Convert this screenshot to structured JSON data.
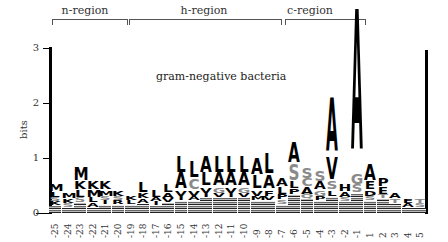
{
  "chart_data": {
    "type": "sequence-logo",
    "title": "gram-negative bacteria",
    "xlabel": "",
    "ylabel": "bits",
    "ylim": [
      0,
      3
    ],
    "yticks": [
      "0",
      "1",
      "2",
      "3"
    ],
    "regions": [
      {
        "label": "n-region",
        "from": "-25",
        "to": "-20"
      },
      {
        "label": "h-region",
        "from": "-19",
        "to": "-8"
      },
      {
        "label": "c-region",
        "from": "-6",
        "to": "-1"
      }
    ],
    "positions": [
      "-25",
      "-24",
      "-23",
      "-22",
      "-21",
      "-20",
      "-19",
      "-18",
      "-17",
      "-16",
      "-15",
      "-14",
      "-13",
      "-12",
      "-11",
      "-10",
      "-9",
      "-8",
      "-7",
      "-6",
      "-5",
      "-4",
      "-3",
      "-2",
      "-1",
      "1",
      "2",
      "3",
      "4",
      "5"
    ],
    "stacks": [
      {
        "pos": "-25",
        "total": 0.5,
        "letters": [
          {
            "aa": "M",
            "bits": 0.12
          },
          {
            "aa": "L",
            "bits": 0.1
          },
          {
            "aa": "K",
            "bits": 0.08
          },
          {
            "aa": "S",
            "bits": 0.08
          }
        ]
      },
      {
        "pos": "-24",
        "total": 0.35,
        "letters": [
          {
            "aa": "M",
            "bits": 0.1
          },
          {
            "aa": "K",
            "bits": 0.08
          },
          {
            "aa": "S",
            "bits": 0.07
          }
        ]
      },
      {
        "pos": "-23",
        "total": 0.8,
        "letters": [
          {
            "aa": "M",
            "bits": 0.25
          },
          {
            "aa": "K",
            "bits": 0.15
          },
          {
            "aa": "L",
            "bits": 0.12
          },
          {
            "aa": "S",
            "bits": 0.1
          }
        ]
      },
      {
        "pos": "-22",
        "total": 0.55,
        "letters": [
          {
            "aa": "K",
            "bits": 0.15
          },
          {
            "aa": "M",
            "bits": 0.12
          },
          {
            "aa": "L",
            "bits": 0.1
          },
          {
            "aa": "A",
            "bits": 0.08
          }
        ]
      },
      {
        "pos": "-21",
        "total": 0.55,
        "letters": [
          {
            "aa": "K",
            "bits": 0.15
          },
          {
            "aa": "M",
            "bits": 0.1
          },
          {
            "aa": "I",
            "bits": 0.08
          },
          {
            "aa": "S",
            "bits": 0.08
          }
        ]
      },
      {
        "pos": "-20",
        "total": 0.4,
        "letters": [
          {
            "aa": "K",
            "bits": 0.1
          },
          {
            "aa": "R",
            "bits": 0.08
          },
          {
            "aa": "S",
            "bits": 0.08
          }
        ]
      },
      {
        "pos": "-19",
        "total": 0.3,
        "letters": [
          {
            "aa": "K",
            "bits": 0.08
          },
          {
            "aa": "L",
            "bits": 0.07
          }
        ]
      },
      {
        "pos": "-18",
        "total": 0.55,
        "letters": [
          {
            "aa": "L",
            "bits": 0.2
          },
          {
            "aa": "K",
            "bits": 0.1
          },
          {
            "aa": "A",
            "bits": 0.08
          }
        ]
      },
      {
        "pos": "-17",
        "total": 0.4,
        "letters": [
          {
            "aa": "L",
            "bits": 0.12
          },
          {
            "aa": "A",
            "bits": 0.08
          },
          {
            "aa": "I",
            "bits": 0.07
          }
        ]
      },
      {
        "pos": "-16",
        "total": 0.5,
        "letters": [
          {
            "aa": "L",
            "bits": 0.15
          },
          {
            "aa": "A",
            "bits": 0.1
          },
          {
            "aa": "V",
            "bits": 0.07
          }
        ]
      },
      {
        "pos": "-15",
        "total": 1.0,
        "letters": [
          {
            "aa": "A",
            "bits": 0.3
          },
          {
            "aa": "L",
            "bits": 0.3
          },
          {
            "aa": "V",
            "bits": 0.1
          },
          {
            "aa": "I",
            "bits": 0.08
          }
        ]
      },
      {
        "pos": "-14",
        "total": 0.9,
        "letters": [
          {
            "aa": "L",
            "bits": 0.3
          },
          {
            "aa": "C",
            "bits": 0.2
          },
          {
            "aa": "V",
            "bits": 0.1
          },
          {
            "aa": "A",
            "bits": 0.08
          }
        ]
      },
      {
        "pos": "-13",
        "total": 1.0,
        "letters": [
          {
            "aa": "A",
            "bits": 0.3
          },
          {
            "aa": "L",
            "bits": 0.25
          },
          {
            "aa": "V",
            "bits": 0.1
          },
          {
            "aa": "I",
            "bits": 0.08
          }
        ]
      },
      {
        "pos": "-12",
        "total": 1.0,
        "letters": [
          {
            "aa": "L",
            "bits": 0.3
          },
          {
            "aa": "A",
            "bits": 0.25
          },
          {
            "aa": "G",
            "bits": 0.1
          },
          {
            "aa": "V",
            "bits": 0.08
          }
        ]
      },
      {
        "pos": "-11",
        "total": 1.0,
        "letters": [
          {
            "aa": "L",
            "bits": 0.3
          },
          {
            "aa": "A",
            "bits": 0.25
          },
          {
            "aa": "V",
            "bits": 0.1
          },
          {
            "aa": "I",
            "bits": 0.08
          }
        ]
      },
      {
        "pos": "-10",
        "total": 1.0,
        "letters": [
          {
            "aa": "L",
            "bits": 0.3
          },
          {
            "aa": "A",
            "bits": 0.25
          },
          {
            "aa": "G",
            "bits": 0.1
          },
          {
            "aa": "V",
            "bits": 0.08
          }
        ]
      },
      {
        "pos": "-9",
        "total": 0.95,
        "letters": [
          {
            "aa": "A",
            "bits": 0.3
          },
          {
            "aa": "L",
            "bits": 0.25
          },
          {
            "aa": "V",
            "bits": 0.1
          },
          {
            "aa": "M",
            "bits": 0.08
          }
        ]
      },
      {
        "pos": "-8",
        "total": 1.0,
        "letters": [
          {
            "aa": "L",
            "bits": 0.35
          },
          {
            "aa": "A",
            "bits": 0.25
          },
          {
            "aa": "F",
            "bits": 0.1
          },
          {
            "aa": "V",
            "bits": 0.08
          }
        ]
      },
      {
        "pos": "-7",
        "total": 0.6,
        "letters": [
          {
            "aa": "A",
            "bits": 0.15
          },
          {
            "aa": "L",
            "bits": 0.12
          },
          {
            "aa": "P",
            "bits": 0.1
          },
          {
            "aa": "S",
            "bits": 0.08
          }
        ]
      },
      {
        "pos": "-6",
        "total": 1.2,
        "letters": [
          {
            "aa": "A",
            "bits": 0.35
          },
          {
            "aa": "S",
            "bits": 0.3
          },
          {
            "aa": "L",
            "bits": 0.12
          },
          {
            "aa": "P",
            "bits": 0.1
          }
        ]
      },
      {
        "pos": "-5",
        "total": 0.8,
        "letters": [
          {
            "aa": "S",
            "bits": 0.2
          },
          {
            "aa": "C",
            "bits": 0.15
          },
          {
            "aa": "A",
            "bits": 0.12
          },
          {
            "aa": "Q",
            "bits": 0.08
          }
        ]
      },
      {
        "pos": "-4",
        "total": 0.75,
        "letters": [
          {
            "aa": "S",
            "bits": 0.2
          },
          {
            "aa": "A",
            "bits": 0.15
          },
          {
            "aa": "G",
            "bits": 0.1
          },
          {
            "aa": "P",
            "bits": 0.08
          }
        ]
      },
      {
        "pos": "-3",
        "total": 1.95,
        "letters": [
          {
            "aa": "A",
            "bits": 1.0
          },
          {
            "aa": "V",
            "bits": 0.4
          },
          {
            "aa": "S",
            "bits": 0.15
          },
          {
            "aa": "L",
            "bits": 0.1
          }
        ]
      },
      {
        "pos": "-2",
        "total": 0.5,
        "letters": [
          {
            "aa": "H",
            "bits": 0.12
          },
          {
            "aa": "A",
            "bits": 0.1
          },
          {
            "aa": "S",
            "bits": 0.08
          }
        ]
      },
      {
        "pos": "-1",
        "total": 3.3,
        "letters": [
          {
            "aa": "A",
            "bits": 2.6
          },
          {
            "aa": "G",
            "bits": 0.2
          },
          {
            "aa": "S",
            "bits": 0.15
          }
        ]
      },
      {
        "pos": "1",
        "total": 0.85,
        "letters": [
          {
            "aa": "A",
            "bits": 0.3
          },
          {
            "aa": "E",
            "bits": 0.15
          },
          {
            "aa": "D",
            "bits": 0.1
          },
          {
            "aa": "S",
            "bits": 0.08
          }
        ]
      },
      {
        "pos": "2",
        "total": 0.6,
        "letters": [
          {
            "aa": "P",
            "bits": 0.15
          },
          {
            "aa": "E",
            "bits": 0.12
          },
          {
            "aa": "T",
            "bits": 0.08
          }
        ]
      },
      {
        "pos": "3",
        "total": 0.35,
        "letters": [
          {
            "aa": "A",
            "bits": 0.1
          },
          {
            "aa": "T",
            "bits": 0.08
          }
        ]
      },
      {
        "pos": "4",
        "total": 0.25,
        "letters": [
          {
            "aa": "E",
            "bits": 0.08
          },
          {
            "aa": "A",
            "bits": 0.07
          }
        ]
      },
      {
        "pos": "5",
        "total": 0.25,
        "letters": [
          {
            "aa": "T",
            "bits": 0.08
          },
          {
            "aa": "S",
            "bits": 0.07
          }
        ]
      }
    ],
    "grid": false,
    "legend": "none"
  },
  "labels": {
    "title": "gram-negative bacteria",
    "ylabel": "bits",
    "regions": [
      "n-region",
      "h-region",
      "c-region"
    ],
    "yticks": [
      "0",
      "1",
      "2",
      "3"
    ]
  },
  "colors": {
    "dark": "#000000",
    "grey": "#8a8a8a"
  }
}
